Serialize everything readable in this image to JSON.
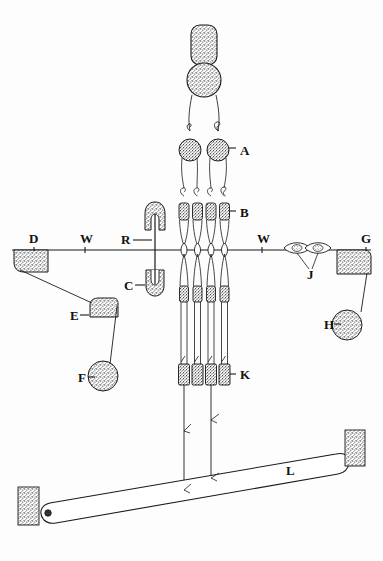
{
  "figure": {
    "background_color": "#fdfdfd",
    "ink_color": "#1a1a1a",
    "width": 383,
    "height": 561
  },
  "labels": [
    {
      "id": "A",
      "text": "A",
      "x": 240,
      "y": 150,
      "leader": "dash-left",
      "describes": "upper paired stippled round node"
    },
    {
      "id": "B",
      "text": "B",
      "x": 240,
      "y": 213,
      "leader": "dash-left",
      "describes": "stippled collar block on vertical strand"
    },
    {
      "id": "C",
      "text": "C",
      "x": 131,
      "y": 288,
      "leader": "dash-right",
      "describes": "lower horseshoe clamp"
    },
    {
      "id": "D",
      "text": "D",
      "x": 33,
      "y": 243,
      "leader": "none",
      "describes": "left rounded block on wire"
    },
    {
      "id": "E",
      "text": "E",
      "x": 74,
      "y": 316,
      "leader": "dash-right",
      "describes": "middle rounded block"
    },
    {
      "id": "F",
      "text": "F",
      "x": 82,
      "y": 379,
      "leader": "dash-right",
      "describes": "lower left stippled disc"
    },
    {
      "id": "G",
      "text": "G",
      "x": 370,
      "y": 243,
      "leader": "none",
      "describes": "right rounded block on wire"
    },
    {
      "id": "H",
      "text": "H",
      "x": 329,
      "y": 326,
      "leader": "dash-right",
      "describes": "right stippled disc"
    },
    {
      "id": "J",
      "text": "J",
      "x": 311,
      "y": 276,
      "leader": "v-pointers",
      "describes": "paired lens shaped beads on wire"
    },
    {
      "id": "K",
      "text": "K",
      "x": 240,
      "y": 376,
      "leader": "dash-left",
      "describes": "lower stippled collar block"
    },
    {
      "id": "L",
      "text": "L",
      "x": 290,
      "y": 472,
      "leader": "none",
      "describes": "long pivoted bar"
    },
    {
      "id": "R",
      "text": "R",
      "x": 128,
      "y": 243,
      "leader": "dash-right",
      "describes": "upper horseshoe clamp"
    },
    {
      "id": "W1",
      "text": "W",
      "x": 85,
      "y": 243,
      "leader": "tick-down",
      "describes": "wire left span"
    },
    {
      "id": "W2",
      "text": "W",
      "x": 262,
      "y": 243,
      "leader": "tick-down",
      "describes": "wire right span"
    }
  ],
  "parts": {
    "wire": {
      "name": "horizontal wire",
      "y": 250,
      "x1": 12,
      "x2": 371
    },
    "strands": {
      "name": "vertical strands",
      "x_positions": [
        184,
        197.5,
        211,
        224.5
      ],
      "top_y": 95,
      "bottom_y": 400
    },
    "top_cap": {
      "name": "stippled capsule",
      "cx": 204,
      "cy": 45,
      "w": 26,
      "h": 40
    },
    "top_disc": {
      "name": "stippled disc",
      "cx": 204,
      "cy": 80,
      "r": 17
    },
    "a_nodes": [
      {
        "cx": 190,
        "cy": 150,
        "rx": 11,
        "ry": 11
      },
      {
        "cx": 218,
        "cy": 150,
        "rx": 11,
        "ry": 11
      }
    ],
    "b_blocks": [
      {
        "cx": 184,
        "cy": 211,
        "w": 10,
        "h": 17
      },
      {
        "cx": 197.5,
        "cy": 211,
        "w": 10,
        "h": 17
      },
      {
        "cx": 211,
        "cy": 211,
        "w": 10,
        "h": 17
      },
      {
        "cx": 224.5,
        "cy": 211,
        "w": 10,
        "h": 17
      }
    ],
    "k_blocks": [
      {
        "cx": 184,
        "cy": 374,
        "w": 11,
        "h": 21
      },
      {
        "cx": 197.5,
        "cy": 374,
        "w": 11,
        "h": 21
      },
      {
        "cx": 211,
        "cy": 374,
        "w": 11,
        "h": 21
      },
      {
        "cx": 224.5,
        "cy": 374,
        "w": 11,
        "h": 21
      }
    ],
    "wire_lenses": [
      {
        "cx": 184,
        "cy": 250
      },
      {
        "cx": 197.5,
        "cy": 250
      },
      {
        "cx": 211,
        "cy": 250
      },
      {
        "cx": 224.5,
        "cy": 250
      }
    ],
    "j_lenses": [
      {
        "cx": 297,
        "cy": 248
      },
      {
        "cx": 318,
        "cy": 248
      }
    ],
    "r_clamp": {
      "cx": 155,
      "cy": 215,
      "w": 22,
      "h": 26
    },
    "c_clamp": {
      "cx": 155,
      "cy": 282,
      "w": 20,
      "h": 26
    },
    "d_block": {
      "x": 14,
      "y": 250,
      "w": 34,
      "h": 22
    },
    "e_block": {
      "x": 90,
      "y": 298,
      "w": 28,
      "h": 19
    },
    "f_disc": {
      "cx": 103,
      "cy": 376,
      "r": 15
    },
    "g_block": {
      "x": 337,
      "y": 250,
      "w": 34,
      "h": 24
    },
    "h_disc": {
      "cx": 347,
      "cy": 325,
      "r": 15
    },
    "bar_l": {
      "pivot_x": 48,
      "pivot_y": 513,
      "tip_x": 341,
      "tip_y": 463
    },
    "pad_left": {
      "x": 18,
      "y": 487,
      "w": 21,
      "h": 38
    },
    "pad_right": {
      "x": 345,
      "y": 430,
      "w": 20,
      "h": 36
    }
  }
}
